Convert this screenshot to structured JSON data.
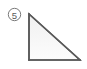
{
  "figure": {
    "label": "5",
    "label_style": "circled-number",
    "shape_name": "right-triangle",
    "background_color": "#ffffff",
    "stroke_color": "#5a5a5a",
    "fill_color_top": "#f1f1f1",
    "fill_color_bottom": "#fbfbfb",
    "marker": {
      "center_x": 14.5,
      "center_y": 14.5,
      "radius": 6.2,
      "circle_stroke_color": "#7a7a7a",
      "digit_color": "#5a5a5a"
    },
    "triangle": {
      "vertices": [
        {
          "name": "top-left-apex",
          "x": 29,
          "y": 14
        },
        {
          "name": "bottom-left-right-angle",
          "x": 29,
          "y": 60
        },
        {
          "name": "bottom-right",
          "x": 80,
          "y": 60
        }
      ],
      "points_attr": "29,14 29,60 80,60",
      "right_angle_at": "bottom-left-right-angle",
      "leg_vertical_label": "",
      "leg_horizontal_label": "",
      "hypotenuse_label": "",
      "stroke_width": 1.6
    }
  },
  "canvas": {
    "width": 87,
    "height": 69
  }
}
